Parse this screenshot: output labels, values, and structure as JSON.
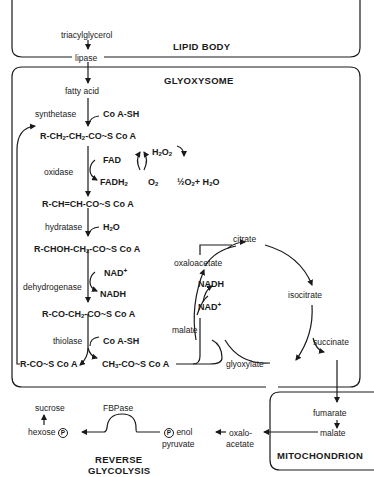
{
  "compartments": {
    "lipid_body": "LIPID BODY",
    "glyoxysome": "GLYOXYSOME",
    "mitochondrion": "MITOCHONDRION",
    "reverse_glycolysis_line1": "REVERSE",
    "reverse_glycolysis_line2": "GLYCOLYSIS"
  },
  "lipid_body": {
    "substrate": "triacylglycerol",
    "enzyme": "lipase"
  },
  "beta_oxidation": {
    "fatty_acid": "fatty acid",
    "step1": {
      "enzyme": "synthetase",
      "cofactor": "Co A-SH"
    },
    "acyl_coa": {
      "prefix": "R-CH",
      "s1": "2",
      "mid": "-CH",
      "s2": "2",
      "suffix": "-CO~S Co A"
    },
    "step2": {
      "enzyme": "oxidase",
      "in": "FAD",
      "out_base": "FADH",
      "out_sub": "2"
    },
    "h2o2": {
      "base1": "H",
      "s1": "2",
      "base2": "O",
      "s2": "2"
    },
    "o2": {
      "base": "O",
      "sub": "2"
    },
    "catalase_products": {
      "half": "½O",
      "s1": "2",
      "plus": "+ H",
      "s2": "2",
      "o": "O"
    },
    "enoyl_coa": "R-CH=CH-CO~S Co A",
    "step3": {
      "enzyme": "hydratase",
      "cofactor_base": "H",
      "cofactor_sub": "2",
      "cofactor_o": "O"
    },
    "hydroxyacyl_coa": {
      "prefix": "R-CHOH-CH",
      "sub": "2",
      "suffix": "-CO~S Co A"
    },
    "step4": {
      "enzyme": "dehydrogenase",
      "in": "NAD",
      "in_sup": "+",
      "out": "NADH"
    },
    "ketoacyl_coa": {
      "prefix": "R-CO-CH",
      "sub": "2",
      "suffix": "-CO~S Co A"
    },
    "step5": {
      "enzyme": "thiolase",
      "cofactor": "Co A-SH"
    },
    "shortened_acyl_coa": "R-CO~S Co A",
    "acetyl_coa": {
      "prefix": "CH",
      "sub": "3",
      "suffix": "-CO~S Co A"
    }
  },
  "glyoxylate_cycle": {
    "citrate": "citrate",
    "isocitrate": "isocitrate",
    "succinate": "succinate",
    "glyoxylate": "glyoxylate",
    "malate": "malate",
    "oxaloacetate": "oxaloacetate",
    "nadh": "NADH",
    "nad": "NAD",
    "nad_sup": "+"
  },
  "mitochondrion": {
    "fumarate": "fumarate",
    "malate": "malate"
  },
  "gluconeogenesis": {
    "oxaloacetate_line1": "oxalo-",
    "oxaloacetate_line2": "acetate",
    "pep_p": "P",
    "pep_line1": "enol",
    "pep_line2": "pyruvate",
    "fbpase": "FBPase",
    "hexose": "hexose",
    "hexose_p": "P",
    "sucrose": "sucrose"
  }
}
